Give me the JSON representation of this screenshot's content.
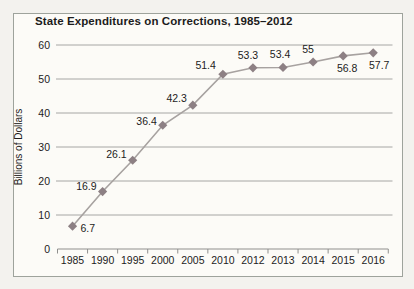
{
  "chart_data": {
    "type": "line",
    "title": "State Expenditures on Corrections, 1985–2012",
    "categories": [
      "1985",
      "1990",
      "1995",
      "2000",
      "2005",
      "2010",
      "2012",
      "2013",
      "2014",
      "2015",
      "2016"
    ],
    "values": [
      6.7,
      16.9,
      26.1,
      36.4,
      42.3,
      51.4,
      53.3,
      53.4,
      55,
      56.8,
      57.7
    ],
    "data_labels": [
      "6.7",
      "16.9",
      "26.1",
      "36.4",
      "42.3",
      "51.4",
      "53.3",
      "53.4",
      "55",
      "56.8",
      "57.7"
    ],
    "xlabel": "",
    "ylabel": "Billions of Dollars",
    "ylim": [
      0,
      60
    ],
    "ytick_step": 10,
    "yticks": [
      "0",
      "10",
      "20",
      "30",
      "40",
      "50",
      "60"
    ],
    "grid": "horizontal",
    "legend": "none",
    "marker": "diamond",
    "colors": {
      "line": "#a7a2a0",
      "marker": "#8d8084",
      "grid": "#a6a6a4",
      "axis": "#8f8f8d",
      "text": "#1c1c1c",
      "frame_border": "#9ea39c",
      "frame_bg": "#fcfbf7",
      "page_bg": "#f3f2ee"
    },
    "label_offsets": [
      {
        "dx": 8,
        "dy": 6,
        "anchor": "start"
      },
      {
        "dx": -6,
        "dy": -2,
        "anchor": "end"
      },
      {
        "dx": -6,
        "dy": -2,
        "anchor": "end"
      },
      {
        "dx": -6,
        "dy": 0,
        "anchor": "end"
      },
      {
        "dx": -6,
        "dy": -3,
        "anchor": "end"
      },
      {
        "dx": -7,
        "dy": -5,
        "anchor": "end"
      },
      {
        "dx": -5,
        "dy": -9,
        "anchor": "middle"
      },
      {
        "dx": -3,
        "dy": -9,
        "anchor": "middle"
      },
      {
        "dx": -5,
        "dy": -9,
        "anchor": "middle"
      },
      {
        "dx": 4,
        "dy": 16,
        "anchor": "middle"
      },
      {
        "dx": 6,
        "dy": 16,
        "anchor": "middle"
      }
    ]
  }
}
